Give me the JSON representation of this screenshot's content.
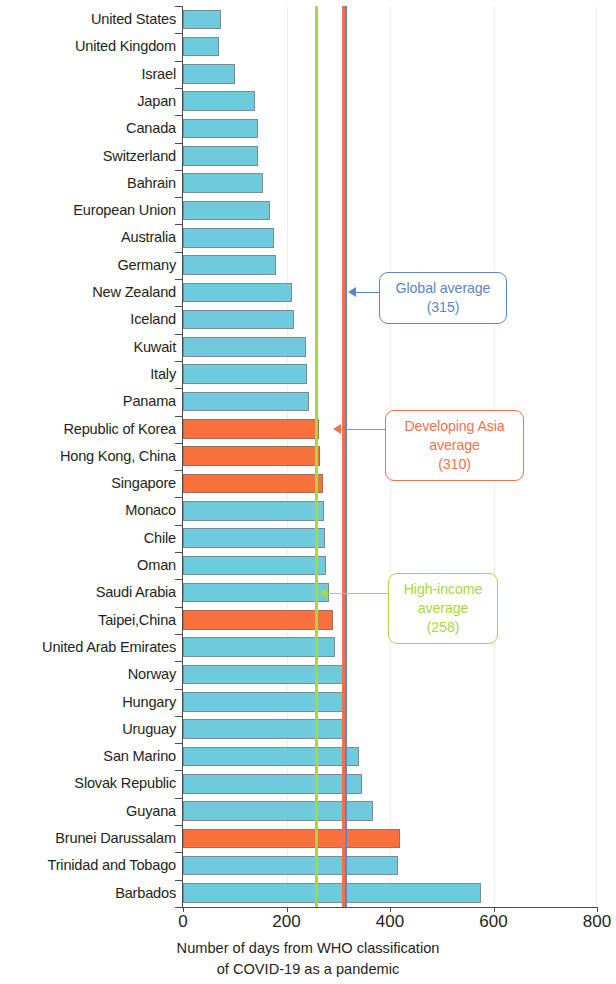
{
  "chart_data": {
    "type": "bar",
    "orientation": "horizontal",
    "title": "",
    "xlabel": "Number of days from WHO classification of COVID-19 as a pandemic",
    "xlabel_lines": [
      "Number of days from WHO classification",
      "of COVID-19 as a pandemic"
    ],
    "ylabel": "",
    "xlim": [
      0,
      800
    ],
    "xticks": [
      0,
      200,
      400,
      600,
      800
    ],
    "xtick_labels": [
      "0",
      "200",
      "400",
      "600",
      "800"
    ],
    "grid": true,
    "legend": "none",
    "categories": [
      "United States",
      "United Kingdom",
      "Israel",
      "Japan",
      "Canada",
      "Switzerland",
      "Bahrain",
      "European Union",
      "Australia",
      "Germany",
      "New Zealand",
      "Iceland",
      "Kuwait",
      "Italy",
      "Panama",
      "Republic of Korea",
      "Hong Kong, China",
      "Singapore",
      "Monaco",
      "Chile",
      "Oman",
      "Saudi Arabia",
      "Taipei,China",
      "United Arab Emirates",
      "Norway",
      "Hungary",
      "Uruguay",
      "San Marino",
      "Slovak Republic",
      "Guyana",
      "Brunei Darussalam",
      "Trinidad and Tobago",
      "Barbados"
    ],
    "values": [
      73,
      70,
      100,
      139,
      144,
      145,
      155,
      168,
      176,
      180,
      211,
      215,
      238,
      240,
      244,
      262,
      265,
      270,
      272,
      274,
      276,
      283,
      289,
      294,
      312,
      312,
      314,
      340,
      346,
      368,
      419,
      415,
      576
    ],
    "bar_colors": [
      "blue",
      "blue",
      "blue",
      "blue",
      "blue",
      "blue",
      "blue",
      "blue",
      "blue",
      "blue",
      "blue",
      "blue",
      "blue",
      "blue",
      "blue",
      "orange",
      "orange",
      "orange",
      "blue",
      "blue",
      "blue",
      "blue",
      "orange",
      "blue",
      "blue",
      "blue",
      "blue",
      "blue",
      "blue",
      "blue",
      "orange",
      "blue",
      "blue"
    ],
    "color_map": {
      "blue": "#6ecbdd",
      "orange": "#f8713c"
    },
    "reference_lines": [
      {
        "id": "high-income-average",
        "label_lines": [
          "High-income",
          "average",
          "(258)"
        ],
        "value": 258,
        "color": "#a8d83c"
      },
      {
        "id": "developing-asia-average",
        "label_lines": [
          "Developing Asia",
          "average",
          "(310)"
        ],
        "value": 310,
        "color": "#f0714c"
      },
      {
        "id": "global-average",
        "label_lines": [
          "Global average",
          "(315)"
        ],
        "value": 315,
        "color": "#5b87c5"
      }
    ]
  },
  "annotations": {
    "global": {
      "line1": "Global average",
      "line2": "(315)",
      "color": "#5b87c5"
    },
    "developing_asia": {
      "line1": "Developing Asia",
      "line2": "average",
      "line3": "(310)",
      "color": "#f0714c"
    },
    "high_income": {
      "line1": "High-income",
      "line2": "average",
      "line3": "(258)",
      "color": "#a8d83c"
    }
  },
  "axis": {
    "tick0": "0",
    "tick200": "200",
    "tick400": "400",
    "tick600": "600",
    "tick800": "800",
    "title_line1": "Number of days from WHO classification",
    "title_line2": "of COVID-19 as a pandemic"
  }
}
